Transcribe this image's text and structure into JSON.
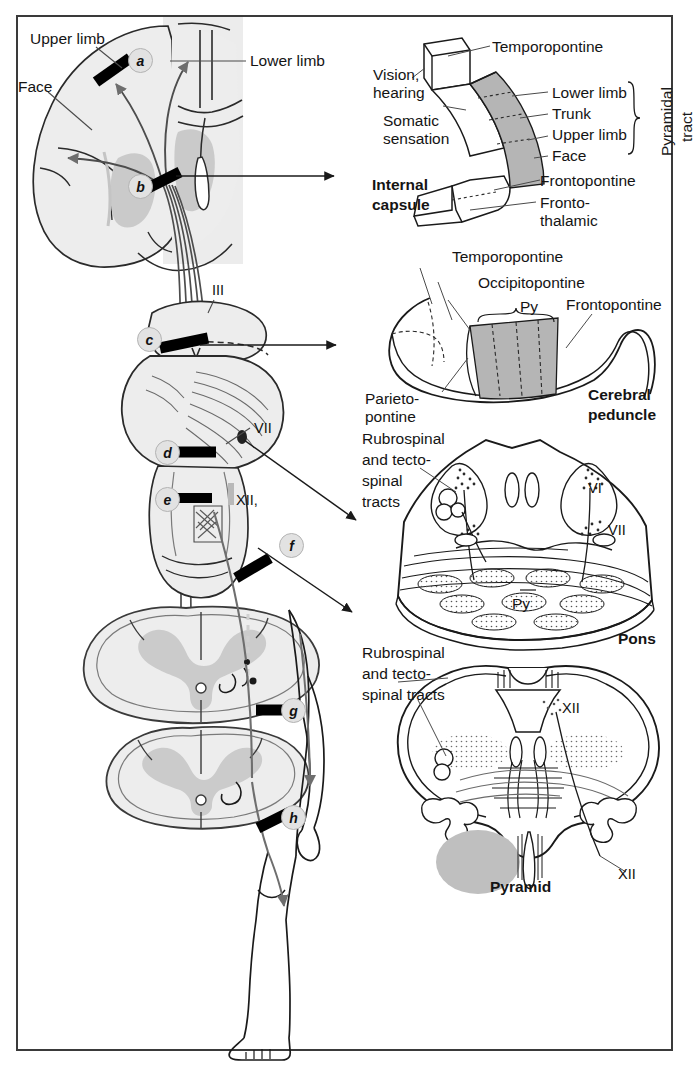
{
  "figure": {
    "frame_color": "#3a3a3a",
    "background": "#ffffff"
  },
  "colors": {
    "brain_fill": "#ededed",
    "nucleus_fill": "#c9c9c9",
    "tract_gray": "#7d7d7d",
    "lesion_bar": "#000000",
    "key_circle": "#e2e2e2",
    "shaded_band": "#b5b5b5",
    "outline": "#1a1a1a"
  },
  "main_panel": {
    "name": "pyramidal-tract-overview",
    "labels": [
      {
        "id": "upper-limb",
        "text": "Upper limb",
        "x": 30,
        "y": 30
      },
      {
        "id": "face",
        "text": "Face",
        "x": 18,
        "y": 78
      },
      {
        "id": "lower-limb",
        "text": "Lower limb",
        "x": 248,
        "y": 57
      }
    ],
    "cranial_nerves": [
      {
        "id": "nerve-III",
        "text": "III",
        "x": 214,
        "y": 287
      },
      {
        "id": "nerve-VII",
        "text": "VII",
        "x": 254,
        "y": 420
      },
      {
        "id": "nerve-XII",
        "text": "XII,",
        "x": 236,
        "y": 494
      }
    ],
    "lesion_keys": [
      {
        "id": "a",
        "label": "a",
        "x": 128,
        "y": 48
      },
      {
        "id": "b",
        "label": "b",
        "x": 128,
        "y": 174
      },
      {
        "id": "c",
        "label": "c",
        "x": 137,
        "y": 327
      },
      {
        "id": "d",
        "label": "d",
        "x": 155,
        "y": 440
      },
      {
        "id": "e",
        "label": "e",
        "x": 155,
        "y": 487
      },
      {
        "id": "f",
        "label": "f",
        "x": 279,
        "y": 533
      },
      {
        "id": "g",
        "label": "g",
        "x": 281,
        "y": 698
      },
      {
        "id": "h",
        "label": "h",
        "x": 281,
        "y": 805
      }
    ]
  },
  "internal_capsule": {
    "name": "internal-capsule-inset",
    "title": "Internal\ncapsule",
    "title_line1": "Internal",
    "title_line2": "capsule",
    "labels": [
      {
        "id": "temporopontine",
        "text": "Temporopontine"
      },
      {
        "id": "vision-hearing",
        "text": "Vision,\nhearing",
        "line1": "Vision,",
        "line2": "hearing"
      },
      {
        "id": "somatic-sensation",
        "text": "Somatic\nsensation",
        "line1": "Somatic",
        "line2": "sensation"
      },
      {
        "id": "lower-limb",
        "text": "Lower limb"
      },
      {
        "id": "trunk",
        "text": "Trunk"
      },
      {
        "id": "upper-limb",
        "text": "Upper limb"
      },
      {
        "id": "face",
        "text": "Face"
      },
      {
        "id": "frontopontine",
        "text": "Frontopontine"
      },
      {
        "id": "frontothalamic",
        "text": "Fronto-\nthalamic",
        "line1": "Fronto-",
        "line2": "thalamic"
      }
    ],
    "brace_label_line1": "Pyramidal",
    "brace_label_line2": "tract"
  },
  "cerebral_peduncle": {
    "name": "cerebral-peduncle-inset",
    "title_line1": "Cerebral",
    "title_line2": "peduncle",
    "labels": [
      {
        "id": "temporopontine",
        "text": "Temporopontine"
      },
      {
        "id": "occipitopontine",
        "text": "Occipitopontine"
      },
      {
        "id": "py",
        "text": "Py"
      },
      {
        "id": "frontopontine",
        "text": "Frontopontine"
      },
      {
        "id": "parietopontine-l1",
        "text": "Parieto-"
      },
      {
        "id": "parietopontine-l2",
        "text": "pontine"
      }
    ]
  },
  "pons": {
    "name": "pons-inset",
    "title": "Pons",
    "leader_lines": [
      "Rubrospinal",
      "and tecto-",
      "spinal",
      "tracts"
    ],
    "labels": [
      {
        "id": "nerve-VI",
        "text": "VI"
      },
      {
        "id": "nerve-VII",
        "text": "VII"
      },
      {
        "id": "py",
        "text": "Py"
      }
    ]
  },
  "pyramid": {
    "name": "pyramid-inset",
    "title": "Pyramid",
    "leader_lines": [
      "Rubrospinal",
      "and tecto-",
      "spinal tracts"
    ],
    "labels": [
      {
        "id": "nerve-XII-top",
        "text": "XII"
      },
      {
        "id": "nerve-XII-bottom",
        "text": "XII"
      }
    ]
  }
}
